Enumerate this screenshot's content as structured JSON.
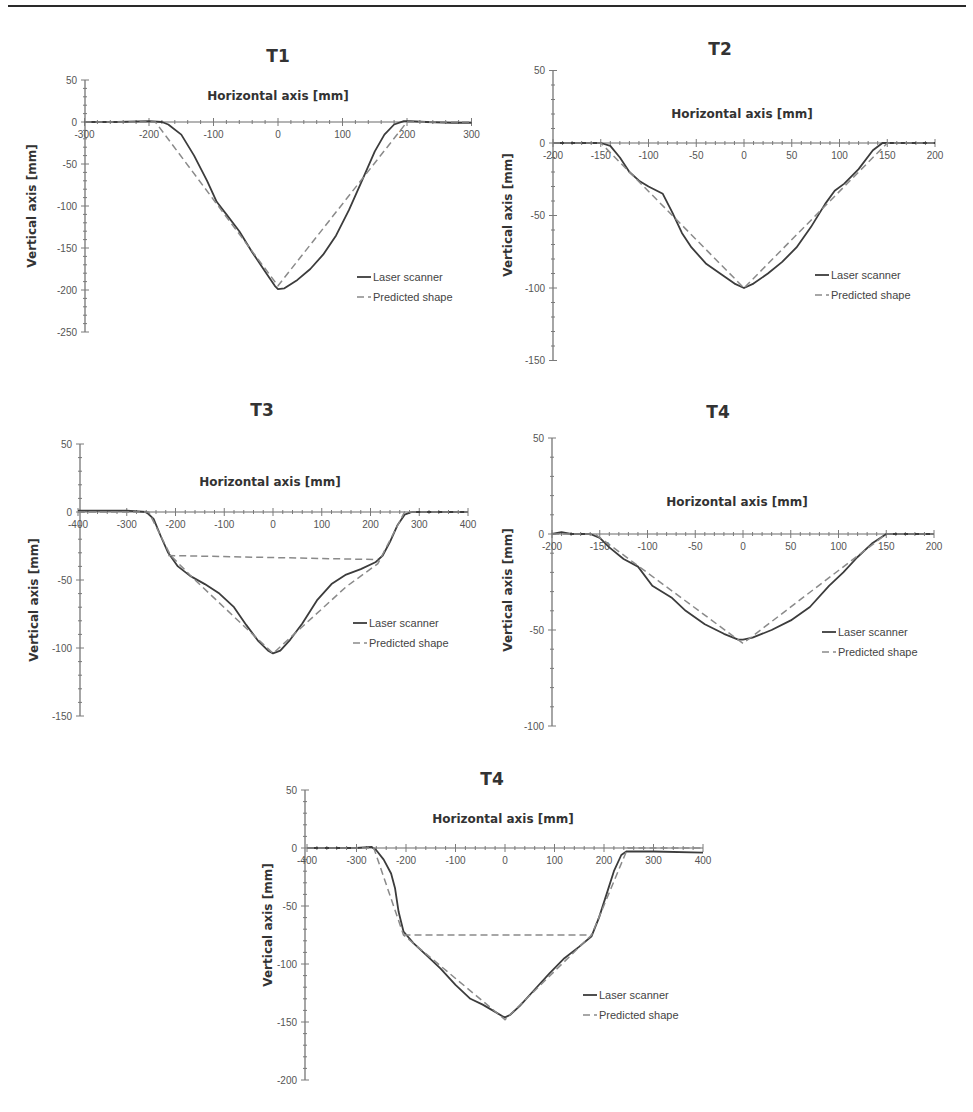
{
  "figure": {
    "legend_labels": {
      "laser": "Laser scanner",
      "predicted": "Predicted shape"
    },
    "colors": {
      "laser": "#3c3c3c",
      "predicted": "#8a8a8a",
      "axis": "#6a6a6a"
    }
  },
  "chart_data": [
    {
      "id": "t1",
      "type": "line",
      "title": "T1",
      "xlabel": "Horizontal axis [mm]",
      "ylabel": "Vertical axis [mm]",
      "xlim": [
        -300,
        300
      ],
      "ylim": [
        -250,
        50
      ],
      "xticks": [
        -300,
        -200,
        -100,
        0,
        100,
        200,
        300
      ],
      "yticks": [
        50,
        0,
        -50,
        -100,
        -150,
        -200,
        -250
      ],
      "x_minor_step": 20,
      "y_minor_step": 10,
      "legend": [
        "Laser scanner",
        "Predicted shape"
      ],
      "series": [
        {
          "name": "Laser scanner",
          "style": "solid",
          "x": [
            -300,
            -250,
            -200,
            -180,
            -170,
            -150,
            -130,
            -110,
            -95,
            -80,
            -60,
            -40,
            -20,
            -5,
            0,
            10,
            30,
            50,
            70,
            90,
            110,
            130,
            150,
            165,
            180,
            195,
            205,
            230,
            270,
            300
          ],
          "y": [
            0,
            0,
            1,
            0,
            -3,
            -15,
            -40,
            -70,
            -95,
            -110,
            -130,
            -155,
            -178,
            -195,
            -199,
            -198,
            -188,
            -175,
            -158,
            -135,
            -105,
            -70,
            -35,
            -15,
            -3,
            1,
            1,
            0,
            -1,
            -1
          ]
        },
        {
          "name": "Predicted shape",
          "style": "dashed",
          "x": [
            -300,
            -190,
            0,
            200,
            300
          ],
          "y": [
            0,
            0,
            -195,
            0,
            0
          ]
        }
      ],
      "layout": {
        "x0px": 278,
        "xpx_per_unit": 0.645,
        "y0px": 122,
        "ypx_per_unit": 0.84,
        "yaxis_x": 85,
        "title_x": 278,
        "title_y": 62,
        "xtitle_x": 278,
        "xtitle_y": 100,
        "ytitle_x": 36,
        "ytitle_y": 206,
        "legend_x": 357,
        "legend_y": 277
      }
    },
    {
      "id": "t2",
      "type": "line",
      "title": "T2",
      "xlabel": "Horizontal axis [mm]",
      "ylabel": "Vertical axis [mm]",
      "xlim": [
        -200,
        200
      ],
      "ylim": [
        -150,
        50
      ],
      "xticks": [
        -200,
        -150,
        -100,
        -50,
        0,
        50,
        100,
        150,
        200
      ],
      "yticks": [
        50,
        0,
        -50,
        -100,
        -150
      ],
      "x_minor_step": 10,
      "y_minor_step": 10,
      "legend": [
        "Laser scanner",
        "Predicted shape"
      ],
      "series": [
        {
          "name": "Laser scanner",
          "style": "solid",
          "x": [
            -200,
            -150,
            -140,
            -130,
            -120,
            -110,
            -100,
            -85,
            -75,
            -65,
            -55,
            -40,
            -25,
            -10,
            0,
            10,
            25,
            40,
            55,
            70,
            85,
            95,
            105,
            120,
            135,
            145,
            155,
            170,
            200
          ],
          "y": [
            0,
            0,
            -2,
            -10,
            -20,
            -26,
            -30,
            -35,
            -48,
            -62,
            -72,
            -83,
            -90,
            -97,
            -100,
            -97,
            -90,
            -82,
            -72,
            -58,
            -42,
            -33,
            -28,
            -18,
            -5,
            0,
            0,
            0,
            0
          ],
          "note": "approx."
        },
        {
          "name": "Predicted shape",
          "style": "dashed",
          "x": [
            -200,
            -150,
            0,
            150,
            200
          ],
          "y": [
            0,
            0,
            -100,
            0,
            0
          ]
        }
      ],
      "layout": {
        "x0px": 744,
        "xpx_per_unit": 0.955,
        "y0px": 143,
        "ypx_per_unit": 1.45,
        "yaxis_x": 553,
        "title_x": 720,
        "title_y": 55,
        "xtitle_x": 742,
        "xtitle_y": 118,
        "ytitle_x": 512,
        "ytitle_y": 215,
        "legend_x": 815,
        "legend_y": 275
      }
    },
    {
      "id": "t3",
      "type": "line",
      "title": "T3",
      "xlabel": "Horizontal axis [mm]",
      "ylabel": "Vertical axis [mm]",
      "xlim": [
        -400,
        400
      ],
      "ylim": [
        -150,
        50
      ],
      "xticks": [
        -400,
        -300,
        -200,
        -100,
        0,
        100,
        200,
        300,
        400
      ],
      "yticks": [
        50,
        0,
        -50,
        -100,
        -150
      ],
      "x_minor_step": 20,
      "y_minor_step": 10,
      "legend": [
        "Laser scanner",
        "Predicted shape"
      ],
      "series": [
        {
          "name": "Laser scanner",
          "style": "solid",
          "x": [
            -400,
            -300,
            -260,
            -245,
            -230,
            -215,
            -195,
            -170,
            -140,
            -110,
            -80,
            -55,
            -30,
            -10,
            0,
            15,
            35,
            60,
            90,
            120,
            150,
            180,
            210,
            225,
            240,
            255,
            270,
            285,
            320,
            400
          ],
          "y": [
            1,
            1,
            0,
            -5,
            -18,
            -30,
            -40,
            -47,
            -53,
            -60,
            -70,
            -83,
            -95,
            -102,
            -104,
            -102,
            -94,
            -82,
            -65,
            -53,
            -46,
            -42,
            -37,
            -32,
            -22,
            -10,
            -2,
            0,
            0,
            0
          ]
        },
        {
          "name": "Predicted shape",
          "style": "dashed",
          "x": [
            -400,
            -255,
            -210,
            -160,
            0,
            150,
            215,
            270,
            400
          ],
          "y": [
            0,
            0,
            -32,
            -50,
            -104,
            -55,
            -38,
            0,
            0
          ]
        },
        {
          "name": "Predicted shape (crest line)",
          "style": "dashed",
          "x": [
            -215,
            215
          ],
          "y": [
            -32,
            -35
          ]
        }
      ],
      "layout": {
        "x0px": 273,
        "xpx_per_unit": 0.4875,
        "y0px": 512,
        "ypx_per_unit": 1.36,
        "yaxis_x": 80,
        "title_x": 262,
        "title_y": 416,
        "xtitle_x": 270,
        "xtitle_y": 486,
        "ytitle_x": 38,
        "ytitle_y": 600,
        "legend_x": 353,
        "legend_y": 623
      }
    },
    {
      "id": "t4a",
      "type": "line",
      "title": "T4",
      "xlabel": "Horizontal axis [mm]",
      "ylabel": "Vertical axis [mm]",
      "xlim": [
        -200,
        200
      ],
      "ylim": [
        -100,
        50
      ],
      "xticks": [
        -200,
        -150,
        -100,
        -50,
        0,
        50,
        100,
        150,
        200
      ],
      "yticks": [
        50,
        0,
        -50,
        -100
      ],
      "x_minor_step": 10,
      "y_minor_step": 10,
      "legend": [
        "Laser scanner",
        "Predicted shape"
      ],
      "series": [
        {
          "name": "Laser scanner",
          "style": "solid",
          "x": [
            -200,
            -190,
            -180,
            -160,
            -150,
            -140,
            -125,
            -110,
            -95,
            -75,
            -60,
            -40,
            -20,
            -5,
            0,
            10,
            30,
            50,
            70,
            90,
            105,
            120,
            135,
            150,
            170,
            200
          ],
          "y": [
            0,
            1,
            0,
            0,
            -2,
            -7,
            -13,
            -17,
            -27,
            -33,
            -40,
            -47,
            -52,
            -55,
            -55,
            -54,
            -50,
            -45,
            -38,
            -27,
            -20,
            -12,
            -5,
            0,
            0,
            0
          ]
        },
        {
          "name": "Predicted shape",
          "style": "dashed",
          "x": [
            -200,
            -155,
            0,
            150,
            200
          ],
          "y": [
            0,
            0,
            -57,
            0,
            0
          ]
        }
      ],
      "layout": {
        "x0px": 743,
        "xpx_per_unit": 0.955,
        "y0px": 534,
        "ypx_per_unit": 1.92,
        "yaxis_x": 552,
        "title_x": 718,
        "title_y": 418,
        "xtitle_x": 737,
        "xtitle_y": 506,
        "ytitle_x": 512,
        "ytitle_y": 590,
        "legend_x": 822,
        "legend_y": 632
      }
    },
    {
      "id": "t4b",
      "type": "line",
      "title": "T4",
      "xlabel": "Horizontal axis [mm]",
      "ylabel": "Vertical axis [mm]",
      "xlim": [
        -400,
        400
      ],
      "ylim": [
        -200,
        50
      ],
      "xticks": [
        -400,
        -300,
        -200,
        -100,
        0,
        100,
        200,
        300,
        400
      ],
      "yticks": [
        50,
        0,
        -50,
        -100,
        -150,
        -200
      ],
      "x_minor_step": 20,
      "y_minor_step": 10,
      "legend": [
        "Laser scanner",
        "Predicted shape"
      ],
      "series": [
        {
          "name": "Laser scanner",
          "style": "solid",
          "x": [
            -400,
            -300,
            -270,
            -260,
            -245,
            -230,
            -222,
            -215,
            -205,
            -185,
            -160,
            -130,
            -100,
            -70,
            -45,
            -25,
            -5,
            0,
            10,
            30,
            60,
            90,
            120,
            150,
            175,
            190,
            205,
            220,
            235,
            245,
            300,
            400
          ],
          "y": [
            0,
            0,
            1,
            -2,
            -10,
            -22,
            -35,
            -55,
            -72,
            -82,
            -92,
            -104,
            -118,
            -130,
            -135,
            -140,
            -145,
            -146,
            -144,
            -136,
            -122,
            -108,
            -95,
            -85,
            -76,
            -60,
            -40,
            -20,
            -6,
            -3,
            -3,
            -4
          ]
        },
        {
          "name": "Predicted shape",
          "style": "dashed",
          "x": [
            -400,
            -265,
            -205,
            0,
            175,
            248,
            400
          ],
          "y": [
            0,
            0,
            -75,
            -148,
            -75,
            0,
            0
          ]
        },
        {
          "name": "Predicted shape (crest line)",
          "style": "dashed",
          "x": [
            -205,
            175
          ],
          "y": [
            -75,
            -75
          ]
        }
      ],
      "layout": {
        "x0px": 505,
        "xpx_per_unit": 0.495,
        "y0px": 848,
        "ypx_per_unit": 1.16,
        "yaxis_x": 305,
        "title_x": 492,
        "title_y": 785,
        "xtitle_x": 503,
        "xtitle_y": 823,
        "ytitle_x": 272,
        "ytitle_y": 925,
        "legend_x": 583,
        "legend_y": 995
      }
    }
  ]
}
